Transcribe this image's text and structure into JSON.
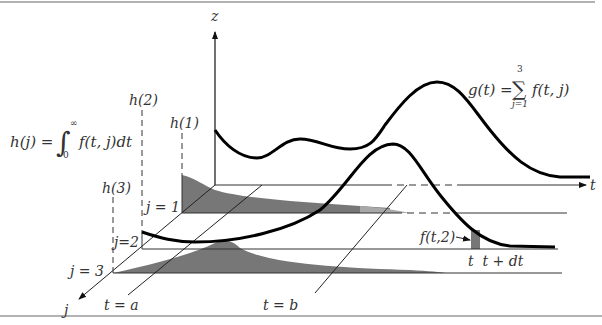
{
  "diagram": {
    "axes": {
      "z_label": "z",
      "t_label": "t",
      "j_label": "j"
    },
    "planes": [
      {
        "label": "j = 1",
        "height_label": "h(1)"
      },
      {
        "label": "j=2",
        "height_label": "h(2)"
      },
      {
        "label": "j = 3",
        "height_label": "h(3)"
      }
    ],
    "time_markers": {
      "a_label": "t = a",
      "b_label": "t = b",
      "interval_label": "t  t + dt",
      "slice_label": "f(t,2)"
    },
    "equations": {
      "h_lhs": "h(j) = ",
      "h_integrand": "f(t, j)dt",
      "h_lower": "0",
      "h_upper": "∞",
      "g_lhs": "g(t) = ",
      "g_sum": "∑",
      "g_upper": "3",
      "g_lower": "j=1",
      "g_rhs": "f(t, j)"
    },
    "colors": {
      "curve": "#000000",
      "fill_dark": "#777777",
      "fill_light": "#a8a8a8",
      "rule": "#999999",
      "line": "#333333"
    }
  }
}
